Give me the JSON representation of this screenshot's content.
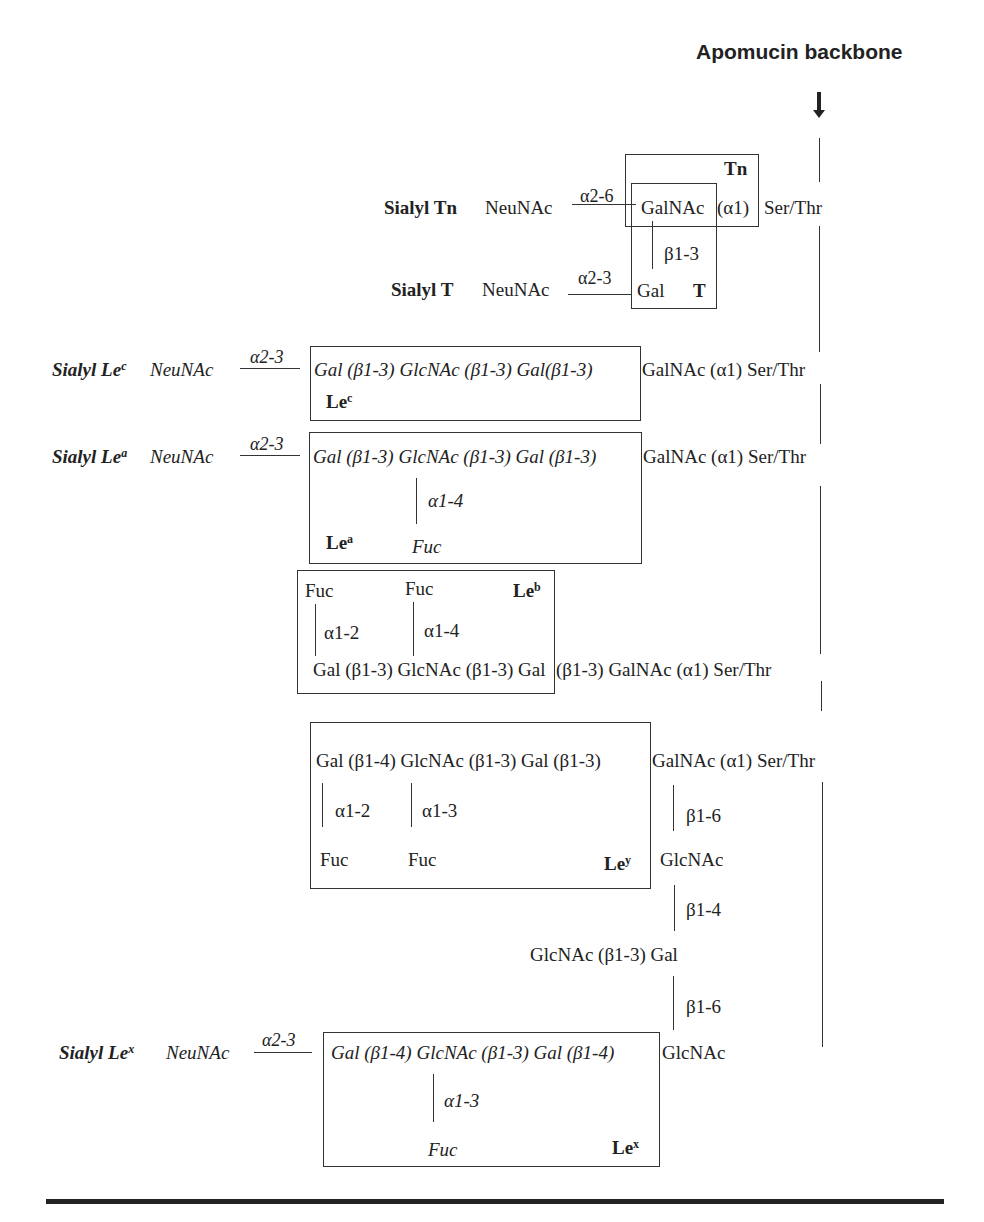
{
  "title": "Apomucin backbone",
  "sialyl_tn": {
    "label": "Sialyl Tn",
    "sugar": "NeuNAc",
    "linkage": "α2-6",
    "core": "GalNAc",
    "alpha": "(α1)",
    "aa": "Ser/Thr",
    "box_label": "Tn"
  },
  "sialyl_t": {
    "label": "Sialyl T",
    "sugar": "NeuNAc",
    "linkage": "α2-3",
    "core": "Gal",
    "beta": "β1-3",
    "box_label": "T"
  },
  "sialyl_lec": {
    "label": "Sialyl Le",
    "sup": "c",
    "sugar": "NeuNAc",
    "linkage": "α2-3",
    "chain": "Gal (β1-3) GlcNAc (β1-3) Gal(β1-3)",
    "tail": "GalNAc (α1) Ser/Thr",
    "box_label": "Le",
    "box_sup": "c"
  },
  "sialyl_lea": {
    "label": "Sialyl Le",
    "sup": "a",
    "sugar": "NeuNAc",
    "linkage": "α2-3",
    "chain": "Gal (β1-3) GlcNAc (β1-3) Gal (β1-3)",
    "tail": "GalNAc (α1) Ser/Thr",
    "branch_linkage": "α1-4",
    "branch_sugar": "Fuc",
    "box_label": "Le",
    "box_sup": "a"
  },
  "leb": {
    "fuc1": "Fuc",
    "fuc2": "Fuc",
    "link1": "α1-2",
    "link2": "α1-4",
    "chain": "Gal (β1-3) GlcNAc (β1-3) Gal",
    "tail": "(β1-3) GalNAc (α1) Ser/Thr",
    "box_label": "Le",
    "box_sup": "b"
  },
  "ley": {
    "chain": "Gal (β1-4) GlcNAc (β1-3) Gal (β1-3)",
    "tail": "GalNAc (α1) Ser/Thr",
    "link1": "α1-2",
    "link2": "α1-3",
    "fuc1": "Fuc",
    "fuc2": "Fuc",
    "box_label": "Le",
    "box_sup": "y",
    "branch1_link": "β1-6",
    "branch1_sugar": "GlcNAc",
    "branch2_link": "β1-4",
    "branch2_sugar": "GlcNAc (β1-3) Gal",
    "branch3_link": "β1-6"
  },
  "sialyl_lex": {
    "label": "Sialyl Le",
    "sup": "x",
    "sugar": "NeuNAc",
    "linkage": "α2-3",
    "chain": "Gal (β1-4) GlcNAc (β1-3) Gal (β1-4)",
    "tail": "GlcNAc",
    "branch_linkage": "α1-3",
    "branch_sugar": "Fuc",
    "box_label": "Le",
    "box_sup": "x"
  }
}
